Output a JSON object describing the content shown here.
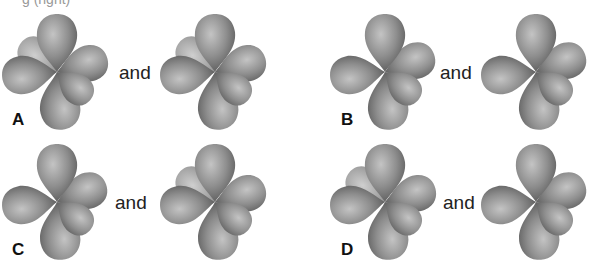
{
  "header": {
    "cutoff_text": "g (right)"
  },
  "connector": "and",
  "colors": {
    "lobe_light": "#b8b8b8",
    "lobe_mid": "#8c8c8c",
    "lobe_dark": "#5e5e5e",
    "label": "#111111"
  },
  "options": [
    {
      "label": "A",
      "left": "with-back-lobe",
      "right": "with-back-lobe"
    },
    {
      "label": "B",
      "left": "without-back-lobe",
      "right": "without-back-lobe"
    },
    {
      "label": "C",
      "left": "without-back-lobe",
      "right": "with-back-lobe"
    },
    {
      "label": "D",
      "left": "with-back-lobe",
      "right": "without-back-lobe"
    }
  ]
}
